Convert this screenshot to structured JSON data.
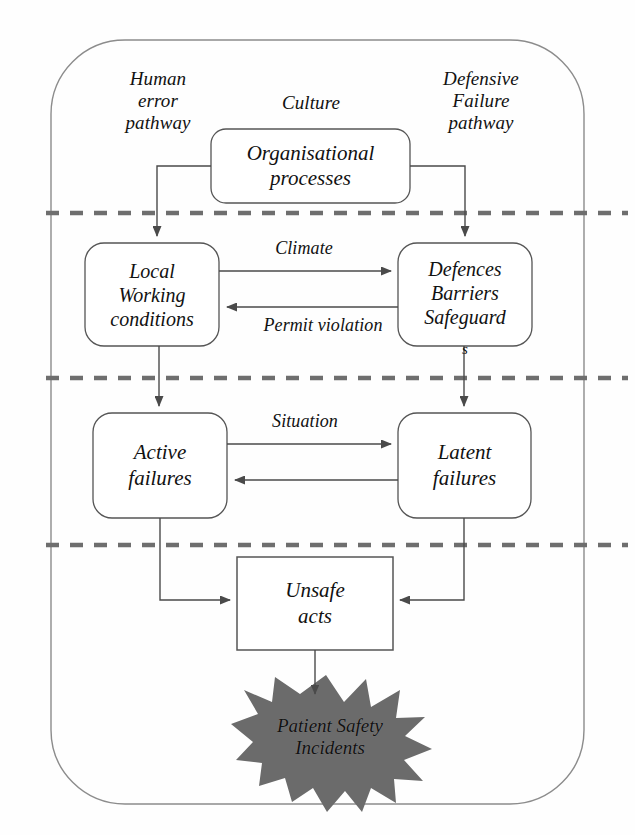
{
  "diagram": {
    "colors": {
      "stroke": "#4a4a4a",
      "box_stroke": "#555555",
      "dash": "#6e6e6e",
      "burst_fill": "#6b6b6b",
      "text": "#111111",
      "background": "#fefefe"
    },
    "pathway_labels": [
      {
        "id": "human-error-pathway",
        "text": "Human\nerror\npathway"
      },
      {
        "id": "culture",
        "text": "Culture"
      },
      {
        "id": "defensive-failure-pathway",
        "text": "Defensive\nFailure\npathway"
      }
    ],
    "nodes": [
      {
        "id": "organisational-processes",
        "text": "Organisational\nprocesses",
        "shape": "rounded-rect"
      },
      {
        "id": "local-working-conditions",
        "text": "Local\nWorking\nconditions",
        "shape": "rounded-rect"
      },
      {
        "id": "defences-barriers-safeguards",
        "text": "Defences\nBarriers\nSafeguard",
        "overflow_text": "s",
        "shape": "rounded-rect"
      },
      {
        "id": "active-failures",
        "text": "Active\nfailures",
        "shape": "rounded-rect"
      },
      {
        "id": "latent-failures",
        "text": "Latent\nfailures",
        "shape": "rounded-rect"
      },
      {
        "id": "unsafe-acts",
        "text": "Unsafe\nacts",
        "shape": "rect"
      },
      {
        "id": "patient-safety-incidents",
        "text": "Patient Safety\nIncidents",
        "shape": "starburst"
      }
    ],
    "edge_labels": [
      {
        "id": "climate",
        "text": "Climate"
      },
      {
        "id": "permit-violation",
        "text": "Permit violation"
      },
      {
        "id": "situation",
        "text": "Situation"
      }
    ],
    "dividers": [
      {
        "id": "divider-1",
        "y": 213
      },
      {
        "id": "divider-2",
        "y": 378
      },
      {
        "id": "divider-3",
        "y": 545
      }
    ]
  }
}
